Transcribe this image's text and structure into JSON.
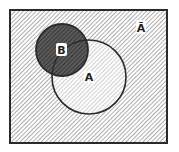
{
  "diagram": {
    "type": "venn",
    "universe_label": "Ā",
    "sets": [
      {
        "name": "B",
        "label": "B",
        "cx": 62,
        "cy": 50,
        "r": 26
      },
      {
        "name": "A",
        "label": "A",
        "cx": 89,
        "cy": 77,
        "r": 37
      }
    ],
    "box": {
      "x": 10,
      "y": 10,
      "w": 157,
      "h": 133
    },
    "colors": {
      "line": "#2a2a2a",
      "hatch": "#555555",
      "background": "#ffffff"
    }
  }
}
